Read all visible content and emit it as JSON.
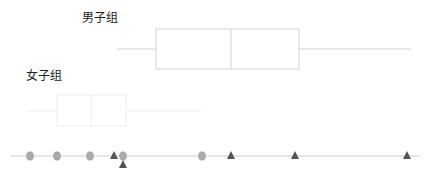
{
  "chart_data": {
    "type": "boxplot",
    "title": "",
    "xlabel": "",
    "ylabel": "",
    "grid": false,
    "series": [
      {
        "name": "男子组",
        "whisker_low": 117,
        "q1": 156,
        "median": 231,
        "q3": 299,
        "whisker_high": 411,
        "y_center": 49,
        "box_top": 29,
        "box_bottom": 69,
        "label_x": 82,
        "label_y": 22,
        "color": "#d4d4d4"
      },
      {
        "name": "女子组",
        "whisker_low": 27,
        "q1": 57,
        "median": 91,
        "q3": 126,
        "whisker_high": 202,
        "y_center": 111,
        "box_top": 95,
        "box_bottom": 126,
        "label_x": 26,
        "label_y": 80,
        "color": "#eeeeee"
      }
    ],
    "strip": {
      "axis_y": 156,
      "axis_x_start": 10,
      "axis_x_end": 420,
      "female_points": [
        30,
        57,
        90,
        123,
        202
      ],
      "male_points": [
        114,
        123,
        231,
        295,
        407
      ],
      "male_offset_points": [
        {
          "x": 123,
          "y": 165
        }
      ],
      "female_marker": "circle",
      "male_marker": "triangle",
      "female_color": "#aaaaaa",
      "male_color": "#555555"
    }
  },
  "labels": {
    "male": "男子组",
    "female": "女子组"
  }
}
